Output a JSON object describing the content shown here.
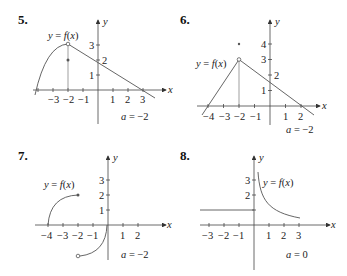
{
  "problems": [
    {
      "number": "5.",
      "func_label": "y = f(x)",
      "a_label": "a = −2",
      "x_ticks": [
        "−3",
        "−2",
        "−1",
        "1",
        "2",
        "3"
      ],
      "y_ticks": [
        "1",
        "2",
        "3"
      ],
      "x_axis": "x",
      "y_axis": "y"
    },
    {
      "number": "6.",
      "func_label": "y = f(x)",
      "a_label": "a = −2",
      "x_ticks": [
        "−4",
        "−3",
        "−2",
        "−1",
        "1",
        "2"
      ],
      "y_ticks": [
        "1",
        "2",
        "3",
        "4"
      ],
      "x_axis": "x",
      "y_axis": "y"
    },
    {
      "number": "7.",
      "func_label": "y = f(x)",
      "a_label": "a = −2",
      "x_ticks": [
        "−4",
        "−3",
        "−2",
        "−1",
        "1",
        "2"
      ],
      "y_ticks": [
        "1",
        "2",
        "3"
      ],
      "x_axis": "x",
      "y_axis": "y"
    },
    {
      "number": "8.",
      "func_label": "y = f(x)",
      "a_label": "a = 0",
      "x_ticks": [
        "−3",
        "−2",
        "−1",
        "1",
        "2",
        "3"
      ],
      "y_ticks": [
        "2",
        "3"
      ],
      "x_axis": "x",
      "y_axis": "y"
    }
  ]
}
